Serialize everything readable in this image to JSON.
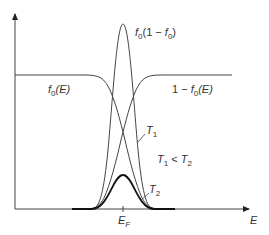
{
  "diagram": {
    "colors": {
      "line": "#444444",
      "thick_line": "#111111",
      "text": "#333333",
      "background": "#ffffff"
    },
    "axes": {
      "x_label": "E",
      "x_tick_label": "E",
      "x_tick_sub": "F"
    },
    "labels": {
      "f0": {
        "main": "f",
        "sub": "0",
        "rest": "(E)"
      },
      "one_minus_f0": {
        "prefix": "1 − ",
        "main": "f",
        "sub": "0",
        "rest": "(E)"
      },
      "product": {
        "main": "f",
        "sub": "0",
        "mid": "(1 − ",
        "main2": "f",
        "sub2": "0",
        "end": ")"
      },
      "t1": {
        "main": "T",
        "sub": "1"
      },
      "t2": {
        "main": "T",
        "sub": "2"
      },
      "relation": {
        "a": "T",
        "a_sub": "1",
        "op": " < ",
        "b": "T",
        "b_sub": "2"
      }
    }
  }
}
